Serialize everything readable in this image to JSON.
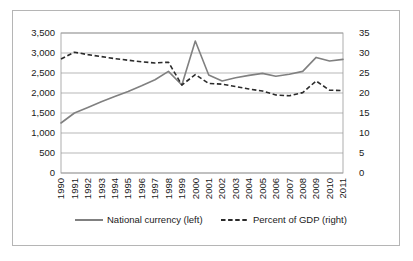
{
  "chart_data": {
    "type": "line",
    "title": "",
    "xlabel": "",
    "ylabel": "",
    "grid": true,
    "legend_position": "bottom",
    "categories": [
      "1990",
      "1991",
      "1992",
      "1993",
      "1994",
      "1995",
      "1996",
      "1997",
      "1998",
      "1999",
      "2000",
      "2001",
      "2002",
      "2003",
      "2004",
      "2005",
      "2006",
      "2007",
      "2008",
      "2009",
      "2010",
      "2011"
    ],
    "axes": {
      "left": {
        "label": "",
        "min": 0,
        "max": 3500,
        "step": 500,
        "ticks": [
          "0",
          "500",
          "1,000",
          "1,500",
          "2,000",
          "2,500",
          "3,000",
          "3,500"
        ],
        "tick_values": [
          0,
          500,
          1000,
          1500,
          2000,
          2500,
          3000,
          3500
        ]
      },
      "right": {
        "label": "",
        "min": 0,
        "max": 35,
        "step": 5,
        "ticks": [
          "0",
          "5",
          "10",
          "15",
          "20",
          "25",
          "30",
          "35"
        ],
        "tick_values": [
          0,
          5,
          10,
          15,
          20,
          25,
          30,
          35
        ]
      }
    },
    "series": [
      {
        "name": "National currency (left)",
        "axis": "left",
        "style": "solid",
        "color": "#808080",
        "values": [
          1250,
          1500,
          1640,
          1780,
          1910,
          2040,
          2180,
          2330,
          2540,
          2200,
          3300,
          2450,
          2300,
          2380,
          2440,
          2490,
          2420,
          2470,
          2540,
          2890,
          2800,
          2840
        ]
      },
      {
        "name": "Percent of GDP (right)",
        "axis": "right",
        "style": "dashed",
        "color": "#2b2b2b",
        "values": [
          28.5,
          30.2,
          29.6,
          29.1,
          28.6,
          28.2,
          27.8,
          27.5,
          27.7,
          22.0,
          24.6,
          22.4,
          22.2,
          21.6,
          21.0,
          20.5,
          19.5,
          19.3,
          20.1,
          23.0,
          20.7,
          20.6
        ]
      }
    ]
  },
  "legend": {
    "items": [
      {
        "label": "National currency (left)",
        "style": "solid",
        "color": "#808080"
      },
      {
        "label": "Percent of GDP (right)",
        "style": "dashed",
        "color": "#2b2b2b"
      }
    ]
  },
  "colors": {
    "national_currency": "#808080",
    "percent_of_gdp": "#2b2b2b",
    "grid": "#9a9a9a",
    "border": "#b5b5b5",
    "text": "#1a1a1a",
    "background": "#ffffff"
  }
}
